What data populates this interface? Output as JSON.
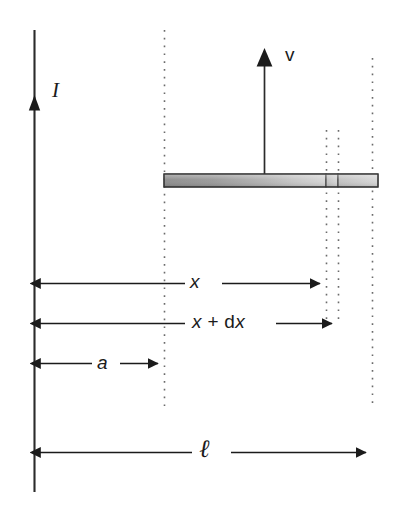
{
  "figure": {
    "type": "physics-diagram",
    "canvas": {
      "width": 396,
      "height": 508,
      "background": "#ffffff"
    },
    "colors": {
      "line": "#1b1b1b",
      "dotted": "#6e6e6e",
      "bar_dark": "#8c8c8c",
      "bar_light": "#d2d2d2",
      "bar_outline": "#3a3a3a"
    },
    "labels": {
      "current": "I",
      "velocity": "v",
      "distance_x": "x",
      "distance_x_plus_dx_prefix": "x",
      "distance_x_plus_dx_operator": " + d",
      "distance_x_plus_dx_suffix": "x",
      "distance_a": "a",
      "length_ell": "ℓ"
    },
    "elements": {
      "current_wire": {
        "name": "vertical current wire",
        "x": 34,
        "y_top": 30,
        "y_bottom": 492,
        "arrow_tip_y": 96
      },
      "velocity_arrow": {
        "name": "velocity arrow on rod",
        "x": 264,
        "y_top": 50,
        "y_bottom": 176
      },
      "rod": {
        "name": "sliding conducting rod",
        "x_left": 164,
        "x_right": 378,
        "y_top": 174,
        "height": 13,
        "divider_x": [
          326,
          338
        ]
      },
      "dotted_lines": [
        {
          "name": "rail at distance a",
          "x": 164,
          "y_top": 30,
          "y_bottom": 412
        },
        {
          "name": "rod position x",
          "x": 326,
          "y_top": 130,
          "y_bottom": 322
        },
        {
          "name": "rod position x plus dx",
          "x": 338,
          "y_top": 130,
          "y_bottom": 322
        },
        {
          "name": "rail at distance ell",
          "x": 372,
          "y_top": 58,
          "y_bottom": 408
        }
      ],
      "dimension_arrows": [
        {
          "name": "x",
          "y": 283,
          "x_start": 34,
          "x_end": 326,
          "label_gap": [
            185,
            222
          ]
        },
        {
          "name": "x + dx",
          "y": 323,
          "x_start": 34,
          "x_end": 338,
          "label_gap": [
            185,
            268
          ]
        },
        {
          "name": "a",
          "y": 363,
          "x_start": 34,
          "x_end": 164,
          "label_gap": [
            92,
            118
          ]
        },
        {
          "name": "ell",
          "y": 452,
          "x_start": 34,
          "x_end": 372,
          "label_gap": [
            192,
            228
          ]
        }
      ]
    }
  }
}
